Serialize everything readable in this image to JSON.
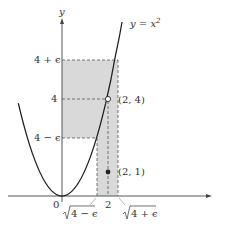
{
  "diagram": {
    "curve": {
      "label_prefix": "y = x",
      "label_exp": "2"
    },
    "axes": {
      "y_label": "y"
    },
    "y_ticks": [
      {
        "label": "4 + ϵ"
      },
      {
        "label": "4"
      },
      {
        "label": "4 − ϵ"
      }
    ],
    "x_ticks": [
      {
        "label": "0"
      },
      {
        "label": "2"
      },
      {
        "label_radicand_left": "4 − ϵ"
      },
      {
        "label_radicand_right": "4 + ϵ"
      }
    ],
    "points": [
      {
        "label": "(2, 4)",
        "style": "open"
      },
      {
        "label": "(2, 1)",
        "style": "filled"
      }
    ],
    "colors": {
      "shade": "#d9d9d9",
      "line": "#222222",
      "dash": "#555555"
    }
  }
}
